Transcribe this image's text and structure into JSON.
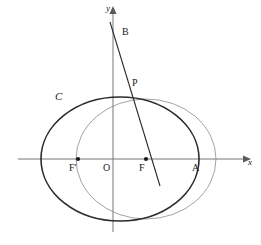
{
  "figure": {
    "type": "geometry-diagram",
    "width": 261,
    "height": 245,
    "background_color": "#ffffff",
    "stroke_color": "#2b2b2b",
    "axis_color": "#767676",
    "thin_curve_color": "#8a8a8a"
  },
  "axes": {
    "origin": {
      "x": 113,
      "y": 159
    },
    "x_axis": {
      "label": "x",
      "label_x": 248,
      "label_y": 162,
      "from_x": 18,
      "to_x": 245,
      "y": 159
    },
    "y_axis": {
      "label": "y",
      "label_x": 107,
      "label_y": 8,
      "x": 113,
      "from_y": 232,
      "to_y": 11
    }
  },
  "points": [
    {
      "name": "O",
      "label": "O",
      "x": 113,
      "y": 159,
      "label_x": 103,
      "label_y": 163,
      "dot": false
    },
    {
      "name": "F",
      "label": "F",
      "x": 146,
      "y": 159,
      "label_x": 139,
      "label_y": 163,
      "dot": true
    },
    {
      "name": "Fp",
      "label": "F′",
      "x": 78,
      "y": 159,
      "label_x": 69,
      "label_y": 163,
      "dot": true
    },
    {
      "name": "A",
      "label": "A",
      "x": 199,
      "y": 159,
      "label_x": 192,
      "label_y": 163,
      "dot": false
    },
    {
      "name": "P",
      "label": "P",
      "x": 128,
      "y": 90,
      "label_x": 132,
      "label_y": 79,
      "dot": false
    },
    {
      "name": "B",
      "label": "B",
      "x": 117,
      "y": 38,
      "label_x": 122,
      "label_y": 28,
      "dot": false
    }
  ],
  "curves": [
    {
      "name": "ellipse-C",
      "label": "C",
      "label_x": 55,
      "label_y": 92,
      "center_x": 120,
      "center_y": 159,
      "radius_x": 79,
      "radius_y": 62,
      "stroke_width": 1.6,
      "color": "#2b2b2b"
    },
    {
      "name": "circle-thin",
      "label": "",
      "center_x": 146,
      "center_y": 159,
      "radius_x": 70,
      "radius_y": 60,
      "stroke_width": 0.8,
      "color": "#8a8a8a"
    }
  ],
  "line_bf": {
    "name": "line-B-P-F",
    "x1": 110,
    "y1": 22,
    "x2": 160,
    "y2": 186,
    "stroke_width": 1.1,
    "color": "#2b2b2b"
  }
}
